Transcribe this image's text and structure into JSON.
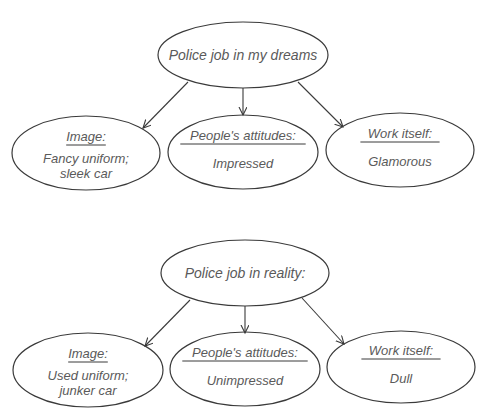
{
  "diagrams": [
    {
      "root": {
        "label": "Police job in my dreams",
        "cx": 243,
        "cy": 55,
        "rx": 85,
        "ry": 33
      },
      "children": [
        {
          "heading": "Image:",
          "lines": [
            "Fancy uniform;",
            "sleek car"
          ],
          "cx": 86,
          "cy": 153,
          "rx": 74,
          "ry": 37
        },
        {
          "heading": "People's attitudes:",
          "lines": [
            "Impressed"
          ],
          "cx": 243,
          "cy": 152,
          "rx": 75,
          "ry": 37
        },
        {
          "heading": "Work itself:",
          "lines": [
            "Glamorous"
          ],
          "cx": 400,
          "cy": 150,
          "rx": 74,
          "ry": 37
        }
      ],
      "edges": [
        {
          "x1": 188,
          "y1": 82,
          "x2": 143,
          "y2": 128
        },
        {
          "x1": 243,
          "y1": 88,
          "x2": 243,
          "y2": 115
        },
        {
          "x1": 298,
          "y1": 82,
          "x2": 343,
          "y2": 127
        }
      ]
    },
    {
      "root": {
        "label": "Police job in reality:",
        "cx": 245,
        "cy": 273,
        "rx": 84,
        "ry": 33
      },
      "children": [
        {
          "heading": "Image:",
          "lines": [
            "Used uniform;",
            "junker car"
          ],
          "cx": 88,
          "cy": 370,
          "rx": 75,
          "ry": 37
        },
        {
          "heading": "People's attitudes:",
          "lines": [
            "Unimpressed"
          ],
          "cx": 245,
          "cy": 369,
          "rx": 75,
          "ry": 37
        },
        {
          "heading": "Work itself:",
          "lines": [
            "Dull"
          ],
          "cx": 401,
          "cy": 367,
          "rx": 74,
          "ry": 36
        }
      ],
      "edges": [
        {
          "x1": 190,
          "y1": 300,
          "x2": 145,
          "y2": 346
        },
        {
          "x1": 245,
          "y1": 306,
          "x2": 245,
          "y2": 333
        },
        {
          "x1": 302,
          "y1": 298,
          "x2": 344,
          "y2": 344
        }
      ]
    }
  ],
  "colors": {
    "stroke": "#3a3a3a",
    "text": "#5a5a5a",
    "background": "#ffffff"
  }
}
